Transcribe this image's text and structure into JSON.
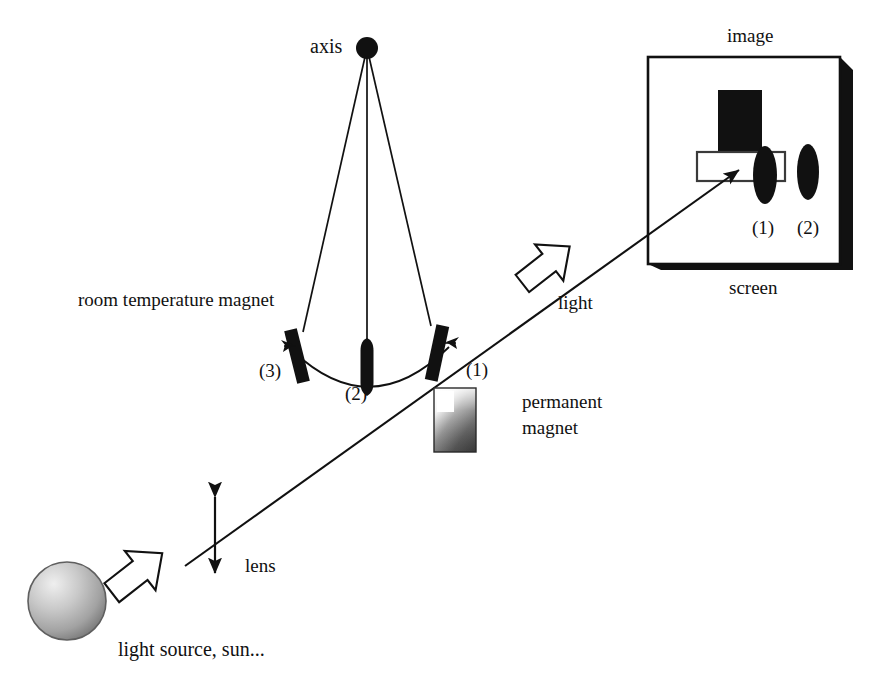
{
  "figure": {
    "title": "",
    "type": "optics-magnetism-schematic",
    "background_color": "#ffffff",
    "ink_color": "#111111"
  },
  "labels": {
    "axis": "axis",
    "image": "image",
    "screen": "screen",
    "room_temperature_magnet": "room temperature magnet",
    "light": "light",
    "lens": "lens",
    "light_source": "light source, sun...",
    "permanent_magnet_line1": "permanent",
    "permanent_magnet_line2": "magnet",
    "bar_3": "(3)",
    "bar_2": "(2)",
    "bar_1": "(1)",
    "spot_1": "(1)",
    "spot_2": "(2)"
  },
  "components": {
    "pivot": {
      "name": "axis-pivot",
      "cx": 367,
      "cy": 48,
      "r": 11,
      "color": "#111111"
    },
    "strings": [
      {
        "name": "string-to-bar-3",
        "x1": 367,
        "y1": 48,
        "x2": 303,
        "y2": 330
      },
      {
        "name": "string-to-bar-2",
        "x1": 367,
        "y1": 48,
        "x2": 367,
        "y2": 342
      },
      {
        "name": "string-to-bar-1",
        "x1": 367,
        "y1": 48,
        "x2": 430,
        "y2": 325
      }
    ],
    "magnet_bars": [
      {
        "name": "magnet-bar-3",
        "label": "(3)",
        "cx": 297,
        "cy": 355,
        "w": 13,
        "h": 54,
        "rotate": -14,
        "arrow_side": "left",
        "color": "#111111"
      },
      {
        "name": "magnet-bar-2",
        "label": "(2)",
        "cx": 367,
        "cy": 368,
        "w": 13,
        "h": 54,
        "rotate": 0,
        "arrow_side": "none",
        "color": "#111111"
      },
      {
        "name": "magnet-bar-1",
        "label": "(1)",
        "cx": 437,
        "cy": 352,
        "w": 13,
        "h": 56,
        "rotate": 12,
        "arrow_side": "right",
        "color": "#111111"
      }
    ],
    "arc": {
      "name": "magnet-swing-arc",
      "from_x": 297,
      "from_y": 354,
      "to_x": 447,
      "to_y": 349,
      "sag_y": 395
    },
    "permanent_magnet": {
      "name": "permanent-magnet",
      "x": 434,
      "y": 388,
      "w": 42,
      "h": 64,
      "dark_color": "#4d4d4d",
      "light_color": "#fdfdfd"
    },
    "light_ray": {
      "name": "light-ray",
      "x1": 185,
      "y1": 566,
      "x2": 740,
      "y2": 170,
      "arrowhead": true
    },
    "lens": {
      "name": "lens-double-arrow",
      "x": 215,
      "y_top": 490,
      "y_bottom": 580
    },
    "block_arrows": [
      {
        "name": "block-arrow-source",
        "cx": 137,
        "cy": 573,
        "angle": -38,
        "scale": 1.0
      },
      {
        "name": "block-arrow-light",
        "cx": 546,
        "cy": 265,
        "angle": -38,
        "scale": 1.0
      }
    ],
    "light_source_sphere": {
      "name": "light-source-sphere",
      "cx": 67,
      "cy": 601,
      "r": 39,
      "highlight_color": "#e6e6e6",
      "mid_color": "#b4b4b4",
      "edge_color": "#6e6e6e"
    },
    "screen_box": {
      "name": "image-screen-box",
      "x": 648,
      "y": 57,
      "w": 192,
      "h": 207,
      "shadow_offset": 13,
      "border_color": "#111111",
      "shadow_color": "#111111",
      "fill_color": "#ffffff"
    },
    "screen_contents": {
      "black_rect": {
        "name": "screen-black-rectangle",
        "x": 718,
        "y": 90,
        "w": 44,
        "h": 61
      },
      "white_rect": {
        "name": "screen-white-rectangle",
        "x": 697,
        "y": 152,
        "w": 88,
        "h": 29
      },
      "ellipses": [
        {
          "name": "screen-spot-1",
          "label": "(1)",
          "cx": 765,
          "cy": 175,
          "rx": 12,
          "ry": 29
        },
        {
          "name": "screen-spot-2",
          "label": "(2)",
          "cx": 808,
          "cy": 172,
          "rx": 11,
          "ry": 28
        }
      ]
    }
  }
}
